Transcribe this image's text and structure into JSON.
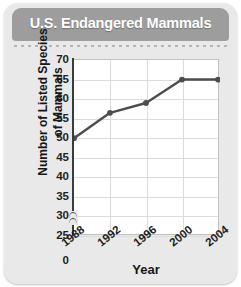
{
  "card": {
    "title": "U.S. Endangered Mammals",
    "header_color": "#9d9d9d",
    "background_color": "#e9e9e9"
  },
  "chart_data": {
    "type": "line",
    "title": "U.S. Endangered Mammals",
    "xlabel": "Year",
    "ylabel": "Number of Listed Species of Mammals",
    "categories": [
      "1988",
      "1992",
      "1996",
      "2000",
      "2004"
    ],
    "x": [
      1988,
      1992,
      1996,
      2000,
      2004
    ],
    "values": [
      50,
      56.5,
      59,
      65,
      65
    ],
    "series": [
      {
        "name": "Listed Mammal Species",
        "values": [
          50,
          56.5,
          59,
          65,
          65
        ],
        "color": "#4d4d4d",
        "marker": "circle"
      }
    ],
    "ylim": [
      25,
      70
    ],
    "y_ticks": [
      70,
      65,
      60,
      55,
      50,
      45,
      40,
      35,
      30,
      25,
      0
    ],
    "y_tick_labels": [
      "70",
      "65",
      "60",
      "55",
      "50",
      "45",
      "40",
      "35",
      "30",
      "25",
      "0"
    ],
    "y_axis_break": true,
    "y_axis_break_between": [
      0,
      25
    ],
    "x_ticks": [
      1988,
      1992,
      1996,
      2000,
      2004
    ],
    "x_tick_labels": [
      "1988",
      "1992",
      "1996",
      "2000",
      "2004"
    ],
    "x_tick_rotation": -38,
    "grid": true,
    "grid_color": "#dcdcdc",
    "legend": false,
    "legend_position": "none",
    "plot_background": "#ffffff",
    "line_color": "#4d4d4d"
  }
}
